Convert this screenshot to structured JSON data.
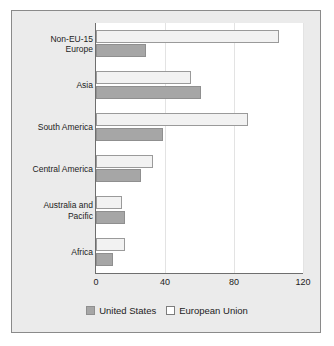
{
  "chart_data": {
    "type": "bar",
    "orientation": "horizontal",
    "title": "",
    "xlabel": "",
    "ylabel": "",
    "xlim": [
      0,
      120
    ],
    "xticks": [
      0,
      40,
      80,
      120
    ],
    "xtick_labels": [
      "0",
      "40",
      "80",
      "120"
    ],
    "grid": true,
    "legend_position": "bottom",
    "categories": [
      "Non-EU-15 Europe",
      "Asia",
      "South America",
      "Central America",
      "Australia and Pacific",
      "Africa"
    ],
    "category_lines": [
      [
        "Non-EU-15",
        "Europe"
      ],
      [
        "Asia"
      ],
      [
        "South America"
      ],
      [
        "Central America"
      ],
      [
        "Australia and",
        "Pacific"
      ],
      [
        "Africa"
      ]
    ],
    "series": [
      {
        "name": "United States",
        "color": "#a6a6a6",
        "values": [
          29,
          61,
          39,
          26,
          17,
          10
        ]
      },
      {
        "name": "European Union",
        "color": "#f2f2f2",
        "values": [
          106,
          55,
          88,
          33,
          15,
          17
        ]
      }
    ]
  },
  "legend": {
    "items": [
      {
        "label": "United States",
        "swatch": "us-swatch"
      },
      {
        "label": "European Union",
        "swatch": "eu-swatch"
      }
    ]
  },
  "colors": {
    "figure_background": "#ebebeb",
    "plot_background": "#ffffff",
    "border": "#8a8a8a",
    "axis": "#6e6e6e",
    "gridline": "#e3e3e3",
    "text": "#1c1c1c",
    "us_bar": "#a6a6a6",
    "eu_bar": "#f2f2f2"
  }
}
